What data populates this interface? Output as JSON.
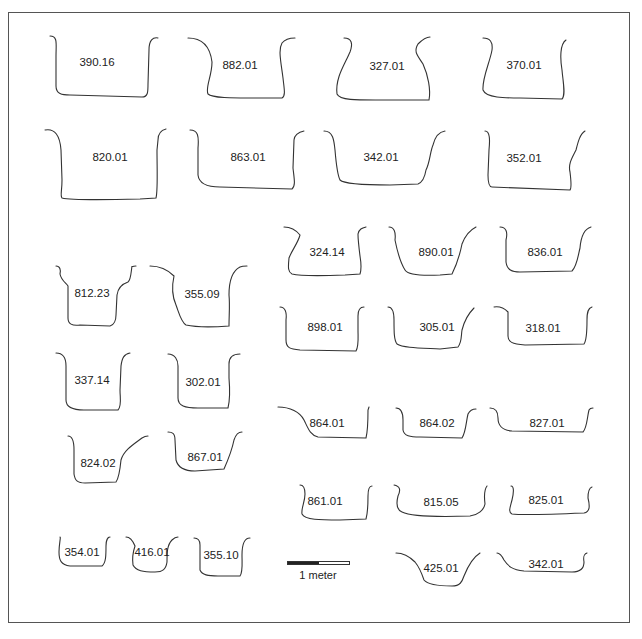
{
  "figure": {
    "type": "archaeological feature cross-section profiles",
    "stroke_color": "#333333",
    "profiles": [
      {
        "id": "390.16",
        "x": 97,
        "y": 62
      },
      {
        "id": "882.01",
        "x": 240,
        "y": 65
      },
      {
        "id": "327.01",
        "x": 387,
        "y": 66
      },
      {
        "id": "370.01",
        "x": 524,
        "y": 65
      },
      {
        "id": "820.01",
        "x": 110,
        "y": 157
      },
      {
        "id": "863.01",
        "x": 248,
        "y": 157
      },
      {
        "id": "342.01",
        "x": 381,
        "y": 157
      },
      {
        "id": "352.01",
        "x": 524,
        "y": 158
      },
      {
        "id": "324.14",
        "x": 327,
        "y": 252
      },
      {
        "id": "890.01",
        "x": 436,
        "y": 252
      },
      {
        "id": "836.01",
        "x": 545,
        "y": 252
      },
      {
        "id": "812.23",
        "x": 92,
        "y": 293
      },
      {
        "id": "355.09",
        "x": 202,
        "y": 294
      },
      {
        "id": "898.01",
        "x": 325,
        "y": 327
      },
      {
        "id": "305.01",
        "x": 437,
        "y": 327
      },
      {
        "id": "318.01",
        "x": 543,
        "y": 328
      },
      {
        "id": "337.14",
        "x": 92,
        "y": 380
      },
      {
        "id": "302.01",
        "x": 203,
        "y": 382
      },
      {
        "id": "864.01",
        "x": 327,
        "y": 423
      },
      {
        "id": "864.02",
        "x": 437,
        "y": 423
      },
      {
        "id": "827.01",
        "x": 547,
        "y": 423
      },
      {
        "id": "824.02",
        "x": 98,
        "y": 463
      },
      {
        "id": "867.01",
        "x": 205,
        "y": 457
      },
      {
        "id": "861.01",
        "x": 325,
        "y": 501
      },
      {
        "id": "815.05",
        "x": 441,
        "y": 502
      },
      {
        "id": "825.01",
        "x": 546,
        "y": 500
      },
      {
        "id": "354.01",
        "x": 82,
        "y": 552
      },
      {
        "id": "416.01",
        "x": 152,
        "y": 552
      },
      {
        "id": "355.10",
        "x": 221,
        "y": 555
      },
      {
        "id": "425.01",
        "x": 441,
        "y": 568
      },
      {
        "id": "342.01",
        "x": 546,
        "y": 564
      }
    ],
    "scale_bar": {
      "label": "1 meter",
      "segments": [
        "#222222",
        "#ffffff"
      ]
    }
  }
}
